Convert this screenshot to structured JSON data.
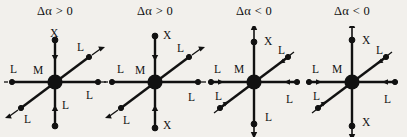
{
  "figure": {
    "background_color": "#f2f0ec",
    "ink_color": "#111111",
    "panel_count": 4
  },
  "panels": [
    {
      "id": "panel-1",
      "title": "Δα > 0",
      "title_delta": "Δα",
      "title_relation": ">",
      "title_value": "0",
      "center_label": "M",
      "labels": {
        "top": "X",
        "bottom": "L",
        "left": "L",
        "right": "L",
        "upper_right": "L",
        "lower_left": "L"
      },
      "arrow_directions": {
        "top": "inward",
        "bottom": "inward",
        "left": "outward",
        "right": "outward",
        "upper_right": "outward",
        "lower_left": "outward"
      }
    },
    {
      "id": "panel-2",
      "title": "Δα > 0",
      "title_delta": "Δα",
      "title_relation": ">",
      "title_value": "0",
      "center_label": "M",
      "labels": {
        "top": "X",
        "bottom": "X",
        "left": "L",
        "right": "L",
        "upper_right": "L",
        "lower_left": "L"
      },
      "arrow_directions": {
        "top": "inward",
        "bottom": "inward",
        "left": "outward",
        "right": "outward",
        "upper_right": "outward",
        "lower_left": "outward"
      }
    },
    {
      "id": "panel-3",
      "title": "Δα < 0",
      "title_delta": "Δα",
      "title_relation": "<",
      "title_value": "0",
      "center_label": "M",
      "labels": {
        "top": "X",
        "bottom": "L",
        "left": "L",
        "right": "L",
        "upper_right": "L",
        "lower_left": "L"
      },
      "arrow_directions": {
        "top": "outward",
        "bottom": "outward",
        "left": "inward",
        "right": "inward",
        "upper_right": "inward",
        "lower_left": "inward"
      }
    },
    {
      "id": "panel-4",
      "title": "Δα < 0",
      "title_delta": "Δα",
      "title_relation": "<",
      "title_value": "0",
      "center_label": "M",
      "labels": {
        "top": "X",
        "bottom": "X",
        "left": "L",
        "right": "L",
        "upper_right": "L",
        "lower_left": "L"
      },
      "arrow_directions": {
        "top": "outward",
        "bottom": "outward",
        "left": "inward",
        "right": "inward",
        "upper_right": "inward",
        "lower_left": "inward"
      }
    }
  ]
}
